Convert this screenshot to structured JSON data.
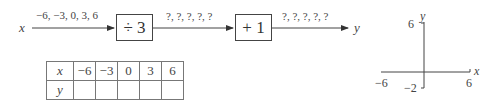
{
  "flow": {
    "input_var": "x",
    "input_values": "−6, −3, 0, 3, 6",
    "step1": {
      "label": "÷ 3"
    },
    "mid_values": "?, ?, ?, ?, ?",
    "step2": {
      "label": "+ 1"
    },
    "output_values": "?, ?, ?, ?, ?",
    "output_var": "y"
  },
  "table": {
    "headers": {
      "row1": "x",
      "row2": "y"
    },
    "x_values": [
      "−6",
      "−3",
      "0",
      "3",
      "6"
    ],
    "y_values": [
      "",
      "",
      "",
      "",
      ""
    ]
  },
  "axes": {
    "x_label": "x",
    "y_label": "y",
    "x_min_label": "−6",
    "x_max_label": "6",
    "y_min_label": "−2",
    "y_max_label": "6",
    "x_range": [
      -6,
      6
    ],
    "y_range": [
      -2,
      6
    ]
  }
}
